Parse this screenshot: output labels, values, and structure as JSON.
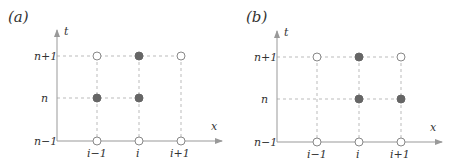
{
  "panels": [
    {
      "label": "(a)",
      "axis_x": "x",
      "axis_t": "t",
      "t_labels": [
        "n+1",
        "n",
        "n−1"
      ],
      "x_labels": [
        "i−1",
        "i",
        "i+1"
      ],
      "points": [
        {
          "col": "i-1",
          "row": "n+1",
          "filled": false
        },
        {
          "col": "i",
          "row": "n+1",
          "filled": true
        },
        {
          "col": "i+1",
          "row": "n+1",
          "filled": false
        },
        {
          "col": "i-1",
          "row": "n",
          "filled": true
        },
        {
          "col": "i",
          "row": "n",
          "filled": true
        },
        {
          "col": "i-1",
          "row": "n-1",
          "filled": false
        },
        {
          "col": "i",
          "row": "n-1",
          "filled": false
        },
        {
          "col": "i+1",
          "row": "n-1",
          "filled": false
        }
      ]
    },
    {
      "label": "(b)",
      "axis_x": "x",
      "axis_t": "t",
      "t_labels": [
        "n+1",
        "n",
        "n−1"
      ],
      "x_labels": [
        "i−1",
        "i",
        "i+1"
      ],
      "points": [
        {
          "col": "i-1",
          "row": "n+1",
          "filled": false
        },
        {
          "col": "i",
          "row": "n+1",
          "filled": true
        },
        {
          "col": "i+1",
          "row": "n+1",
          "filled": false
        },
        {
          "col": "i",
          "row": "n",
          "filled": true
        },
        {
          "col": "i+1",
          "row": "n",
          "filled": true
        },
        {
          "col": "i-1",
          "row": "n-1",
          "filled": false
        },
        {
          "col": "i",
          "row": "n-1",
          "filled": false
        },
        {
          "col": "i+1",
          "row": "n-1",
          "filled": false
        }
      ]
    }
  ],
  "colors": {
    "axis": "#999999",
    "grid": "#aaaaaa",
    "filled_point": "#666666",
    "open_point_stroke": "#888888"
  }
}
